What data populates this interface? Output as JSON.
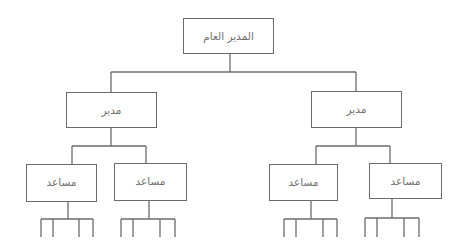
{
  "diagram": {
    "type": "org-chart",
    "line_color": "#6b6b6b",
    "text_color": "#6f6f6f",
    "nodes": [
      {
        "id": "ceo",
        "label": "المدير العام",
        "x": 183,
        "y": 18,
        "w": 91,
        "h": 36,
        "text_top": 11
      },
      {
        "id": "manager_left",
        "label": "مدير",
        "x": 66,
        "y": 92,
        "w": 91,
        "h": 36,
        "text_top": 11
      },
      {
        "id": "manager_right",
        "label": "مدير",
        "x": 311,
        "y": 91,
        "w": 91,
        "h": 37,
        "text_top": 11
      },
      {
        "id": "assistant_1",
        "label": "مساعد",
        "x": 26,
        "y": 164,
        "w": 71,
        "h": 38,
        "text_top": 11
      },
      {
        "id": "assistant_2",
        "label": "مساعد",
        "x": 114,
        "y": 163,
        "w": 73,
        "h": 38,
        "text_top": 11
      },
      {
        "id": "assistant_3",
        "label": "مساعد",
        "x": 269,
        "y": 164,
        "w": 69,
        "h": 37,
        "text_top": 11
      },
      {
        "id": "assistant_4",
        "label": "مساعد",
        "x": 369,
        "y": 163,
        "w": 73,
        "h": 36,
        "text_top": 11
      }
    ],
    "lines": [
      [
        230,
        54,
        230,
        72
      ],
      [
        111,
        72,
        356,
        72
      ],
      [
        111,
        72,
        111,
        92
      ],
      [
        356,
        72,
        356,
        91
      ],
      [
        111,
        128,
        111,
        146
      ],
      [
        72,
        146,
        146,
        146
      ],
      [
        72,
        146,
        72,
        164
      ],
      [
        146,
        146,
        146,
        163
      ],
      [
        356,
        128,
        356,
        146
      ],
      [
        316,
        146,
        390,
        146
      ],
      [
        316,
        146,
        316,
        164
      ],
      [
        390,
        146,
        390,
        163
      ],
      [
        68,
        202,
        68,
        219
      ],
      [
        41,
        219,
        93,
        219
      ],
      [
        41,
        219,
        41,
        237
      ],
      [
        53,
        219,
        53,
        237
      ],
      [
        79,
        219,
        79,
        237
      ],
      [
        93,
        219,
        93,
        237
      ],
      [
        149,
        201,
        149,
        219
      ],
      [
        121,
        219,
        175,
        219
      ],
      [
        121,
        219,
        121,
        237
      ],
      [
        133,
        219,
        133,
        237
      ],
      [
        160,
        219,
        160,
        237
      ],
      [
        175,
        219,
        175,
        237
      ],
      [
        311,
        201,
        311,
        219
      ],
      [
        284,
        219,
        337,
        219
      ],
      [
        284,
        219,
        284,
        237
      ],
      [
        296,
        219,
        296,
        237
      ],
      [
        323,
        219,
        323,
        237
      ],
      [
        337,
        219,
        337,
        237
      ],
      [
        392,
        199,
        392,
        218
      ],
      [
        365,
        218,
        419,
        218
      ],
      [
        365,
        218,
        365,
        237
      ],
      [
        377,
        218,
        377,
        237
      ],
      [
        404,
        218,
        404,
        237
      ],
      [
        419,
        218,
        419,
        237
      ]
    ]
  }
}
